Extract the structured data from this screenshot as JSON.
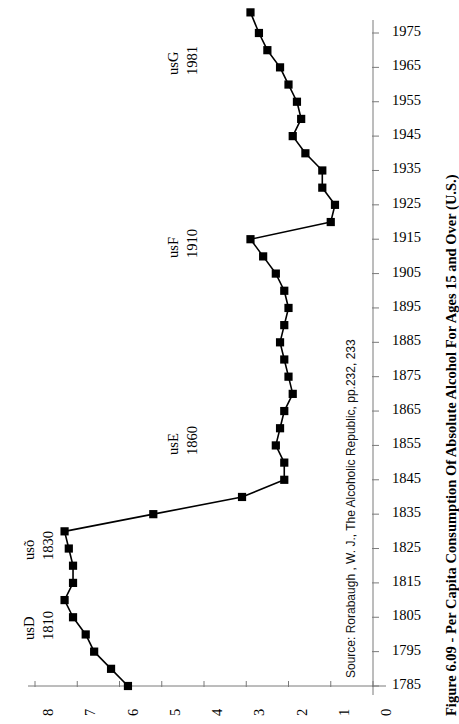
{
  "figure": {
    "title": "Figure 6.09 - Per Capita Consumption Of Absolute Alcohol For Ages 15 and Over (U.S.)",
    "source": "Source: Rorabaugh , W. J., The Alcoholic Republic, pp.232, 233"
  },
  "annotations": [
    {
      "id": "usG",
      "code": "usG",
      "year": "1981"
    },
    {
      "id": "usF",
      "code": "usF",
      "year": "1910"
    },
    {
      "id": "usE",
      "code": "usE",
      "year": "1860"
    },
    {
      "id": "usd",
      "code": "usõ",
      "year": "1830"
    },
    {
      "id": "usD",
      "code": "usD",
      "year": "1810"
    }
  ],
  "chart_data": {
    "type": "line",
    "orientation": "rotated-90",
    "title": "Figure 6.09 - Per Capita Consumption Of Absolute Alcohol For Ages 15 and Over (U.S.)",
    "xlabel": "Gallons of absolute alcohol per capita",
    "ylabel": "Year",
    "grid": false,
    "legend": "none",
    "value_axis": {
      "position": "bottom",
      "ticks": [
        8,
        7,
        6,
        5,
        4,
        3,
        2,
        1,
        0
      ],
      "tick_labels": [
        "8",
        "7",
        "6",
        "5",
        "4",
        "3",
        "2",
        "1",
        "0"
      ],
      "range": [
        8,
        0
      ],
      "direction": "decreasing-left-to-right"
    },
    "year_axis": {
      "position": "right",
      "ticks": [
        1785,
        1795,
        1805,
        1815,
        1825,
        1835,
        1845,
        1855,
        1865,
        1875,
        1885,
        1895,
        1905,
        1915,
        1925,
        1935,
        1945,
        1955,
        1965,
        1975
      ],
      "tick_labels": [
        "1785",
        "1795",
        "1805",
        "1815",
        "1825",
        "1835",
        "1845",
        "1855",
        "1865",
        "1875",
        "1885",
        "1895",
        "1905",
        "1915",
        "1925",
        "1935",
        "1945",
        "1955",
        "1965",
        "1975"
      ],
      "range": [
        1785,
        1980
      ]
    },
    "series": [
      {
        "name": "Per capita absolute alcohol consumption (gallons), ages 15+",
        "marker": "square",
        "color": "#000000",
        "points": [
          {
            "year": 1785,
            "value": 5.8
          },
          {
            "year": 1790,
            "value": 6.2
          },
          {
            "year": 1795,
            "value": 6.6
          },
          {
            "year": 1800,
            "value": 6.8
          },
          {
            "year": 1805,
            "value": 7.1
          },
          {
            "year": 1810,
            "value": 7.3
          },
          {
            "year": 1815,
            "value": 7.1
          },
          {
            "year": 1820,
            "value": 7.1
          },
          {
            "year": 1825,
            "value": 7.2
          },
          {
            "year": 1830,
            "value": 7.3
          },
          {
            "year": 1835,
            "value": 5.2
          },
          {
            "year": 1840,
            "value": 3.1
          },
          {
            "year": 1845,
            "value": 2.1
          },
          {
            "year": 1850,
            "value": 2.1
          },
          {
            "year": 1855,
            "value": 2.3
          },
          {
            "year": 1860,
            "value": 2.2
          },
          {
            "year": 1865,
            "value": 2.1
          },
          {
            "year": 1870,
            "value": 1.9
          },
          {
            "year": 1875,
            "value": 2.0
          },
          {
            "year": 1880,
            "value": 2.1
          },
          {
            "year": 1885,
            "value": 2.2
          },
          {
            "year": 1890,
            "value": 2.1
          },
          {
            "year": 1895,
            "value": 2.0
          },
          {
            "year": 1900,
            "value": 2.1
          },
          {
            "year": 1905,
            "value": 2.3
          },
          {
            "year": 1910,
            "value": 2.6
          },
          {
            "year": 1915,
            "value": 2.9
          },
          {
            "year": 1920,
            "value": 1.0
          },
          {
            "year": 1925,
            "value": 0.9
          },
          {
            "year": 1930,
            "value": 1.2
          },
          {
            "year": 1935,
            "value": 1.2
          },
          {
            "year": 1940,
            "value": 1.6
          },
          {
            "year": 1945,
            "value": 1.9
          },
          {
            "year": 1950,
            "value": 1.7
          },
          {
            "year": 1955,
            "value": 1.8
          },
          {
            "year": 1960,
            "value": 2.0
          },
          {
            "year": 1965,
            "value": 2.2
          },
          {
            "year": 1970,
            "value": 2.5
          },
          {
            "year": 1975,
            "value": 2.7
          },
          {
            "year": 1981,
            "value": 2.9
          }
        ]
      }
    ]
  }
}
